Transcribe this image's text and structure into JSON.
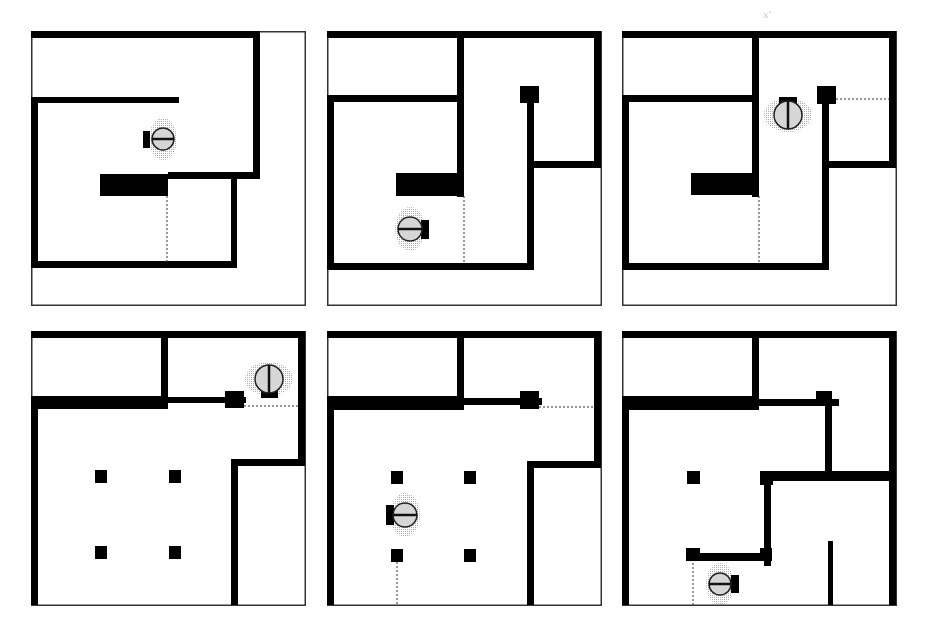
{
  "figure": {
    "stray_mark": "x'",
    "colors": {
      "wall": "#000000",
      "border": "#333333",
      "background": "#ffffff",
      "robot_fill": "#d6d6d6",
      "halo": "#cfcfcf",
      "frontier": "#333333"
    },
    "panels": [
      {
        "id": "panel-1",
        "x": 31,
        "y": 31,
        "walls": [
          [
            0,
            0,
            229,
            7
          ],
          [
            222,
            0,
            7,
            148
          ],
          [
            0,
            66,
            148,
            6
          ],
          [
            0,
            66,
            7,
            171
          ],
          [
            0,
            230,
            206,
            7
          ],
          [
            200,
            141,
            6,
            96
          ],
          [
            137,
            141,
            92,
            7
          ]
        ],
        "blocks": [
          [
            69,
            143,
            68,
            22
          ]
        ],
        "frontiers": [
          [
            136,
            165,
            136,
            231
          ]
        ],
        "robot": {
          "cx": 132,
          "cy": 108,
          "r": 11,
          "line": "h",
          "sensor": [
            112,
            100,
            7,
            17
          ]
        }
      },
      {
        "id": "panel-2",
        "x": 327,
        "y": 31,
        "walls": [
          [
            0,
            0,
            274,
            7
          ],
          [
            267,
            0,
            7,
            136
          ],
          [
            0,
            64,
            136,
            7
          ],
          [
            0,
            64,
            7,
            175
          ],
          [
            130,
            0,
            7,
            166
          ],
          [
            0,
            232,
            206,
            7
          ],
          [
            200,
            72,
            7,
            167
          ],
          [
            207,
            130,
            67,
            7
          ]
        ],
        "blocks": [
          [
            69,
            142,
            68,
            23
          ],
          [
            193,
            55,
            19,
            17
          ]
        ],
        "frontiers": [
          [
            137,
            165,
            137,
            232
          ]
        ],
        "robot": {
          "cx": 83,
          "cy": 198,
          "r": 12,
          "line": "h",
          "sensor": [
            94,
            189,
            8,
            19
          ]
        }
      },
      {
        "id": "panel-3",
        "x": 622,
        "y": 31,
        "walls": [
          [
            0,
            0,
            274,
            7
          ],
          [
            267,
            0,
            7,
            136
          ],
          [
            0,
            64,
            136,
            7
          ],
          [
            0,
            64,
            7,
            175
          ],
          [
            130,
            0,
            7,
            166
          ],
          [
            0,
            232,
            206,
            7
          ],
          [
            200,
            72,
            7,
            167
          ],
          [
            207,
            130,
            67,
            7
          ]
        ],
        "blocks": [
          [
            69,
            142,
            68,
            22
          ],
          [
            195,
            55,
            19,
            18
          ]
        ],
        "frontiers": [
          [
            137,
            165,
            137,
            232
          ],
          [
            214,
            68,
            267,
            68
          ]
        ],
        "robot": {
          "cx": 166,
          "cy": 84,
          "r": 14,
          "line": "v",
          "sensor": [
            157,
            66,
            18,
            8
          ]
        }
      },
      {
        "id": "panel-4",
        "x": 31,
        "y": 331,
        "walls": [
          [
            0,
            0,
            274,
            7
          ],
          [
            267,
            0,
            7,
            133
          ],
          [
            130,
            0,
            7,
            72
          ],
          [
            0,
            65,
            137,
            13
          ],
          [
            0,
            65,
            7,
            209
          ],
          [
            137,
            66,
            78,
            6
          ],
          [
            200,
            128,
            74,
            7
          ],
          [
            200,
            128,
            7,
            146
          ]
        ],
        "blocks": [
          [
            194,
            60,
            19,
            17
          ],
          [
            64,
            139,
            12,
            13
          ],
          [
            138,
            139,
            12,
            13
          ],
          [
            64,
            215,
            12,
            13
          ],
          [
            138,
            215,
            12,
            13
          ]
        ],
        "frontiers": [
          [
            213,
            75,
            267,
            75
          ]
        ],
        "robot": {
          "cx": 238,
          "cy": 48,
          "r": 14,
          "line": "v",
          "sensor": [
            230,
            60,
            17,
            7
          ]
        }
      },
      {
        "id": "panel-5",
        "x": 327,
        "y": 331,
        "walls": [
          [
            0,
            0,
            274,
            7
          ],
          [
            267,
            0,
            7,
            136
          ],
          [
            130,
            0,
            7,
            74
          ],
          [
            0,
            65,
            137,
            14
          ],
          [
            0,
            65,
            7,
            209
          ],
          [
            137,
            67,
            78,
            7
          ],
          [
            200,
            130,
            74,
            7
          ],
          [
            200,
            130,
            7,
            144
          ]
        ],
        "blocks": [
          [
            193,
            60,
            19,
            18
          ],
          [
            64,
            140,
            12,
            13
          ],
          [
            137,
            140,
            12,
            13
          ],
          [
            64,
            218,
            12,
            13
          ],
          [
            137,
            218,
            12,
            13
          ]
        ],
        "frontiers": [
          [
            212,
            76,
            267,
            76
          ],
          [
            70,
            231,
            70,
            274
          ]
        ],
        "robot": {
          "cx": 78,
          "cy": 184,
          "r": 12,
          "line": "h",
          "sensor": [
            59,
            174,
            8,
            20
          ]
        }
      },
      {
        "id": "panel-6",
        "x": 622,
        "y": 331,
        "walls": [
          [
            0,
            0,
            274,
            7
          ],
          [
            267,
            0,
            7,
            274
          ],
          [
            130,
            0,
            7,
            74
          ],
          [
            0,
            65,
            137,
            14
          ],
          [
            0,
            65,
            7,
            209
          ],
          [
            137,
            68,
            80,
            7
          ],
          [
            203,
            60,
            7,
            90
          ],
          [
            144,
            140,
            130,
            10
          ],
          [
            142,
            145,
            7,
            90
          ],
          [
            64,
            222,
            85,
            8
          ],
          [
            206,
            210,
            5,
            64
          ]
        ],
        "blocks": [
          [
            194,
            60,
            16,
            15
          ],
          [
            65,
            140,
            13,
            13
          ],
          [
            138,
            140,
            13,
            14
          ],
          [
            64,
            217,
            14,
            13
          ],
          [
            138,
            217,
            12,
            13
          ]
        ],
        "frontiers": [
          [
            71,
            232,
            71,
            274
          ]
        ],
        "robot": {
          "cx": 98,
          "cy": 253,
          "r": 11,
          "line": "h",
          "sensor": [
            109,
            244,
            8,
            18
          ]
        }
      }
    ]
  }
}
